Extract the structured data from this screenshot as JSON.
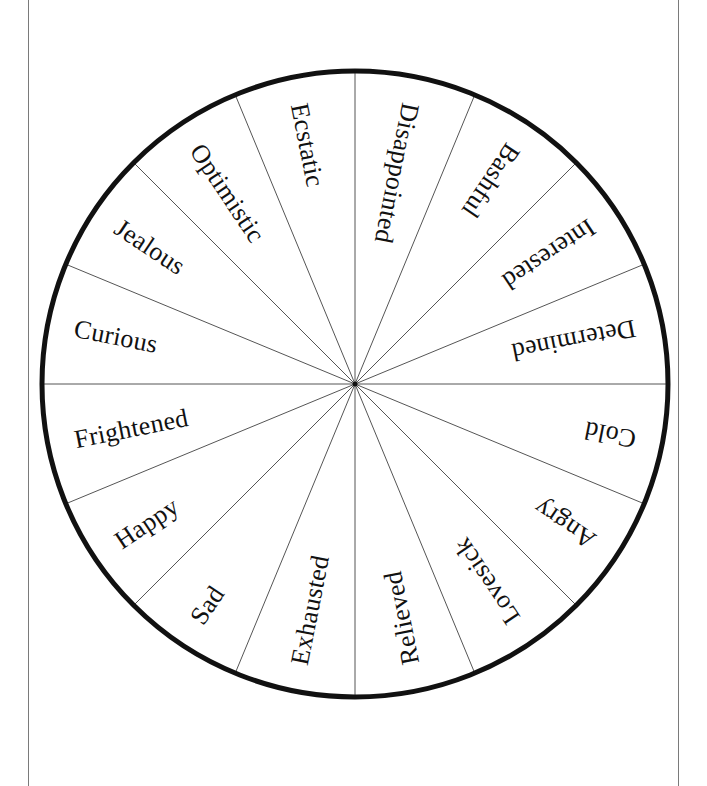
{
  "wheel": {
    "segment_count": 16,
    "labels_clockwise_from_top": [
      "Disappointed",
      "Bashful",
      "Interested",
      "Determined",
      "Cold",
      "Angry",
      "Lovesick",
      "Relieved",
      "Exhausted",
      "Sad",
      "Happy",
      "Frightened",
      "Curious",
      "Jealous",
      "Optimistic",
      "Ecstatic"
    ],
    "colors": {
      "rim": "#111111",
      "divider": "#555555",
      "text": "#111111",
      "background": "#ffffff"
    }
  }
}
